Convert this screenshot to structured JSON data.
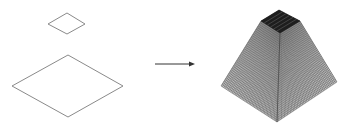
{
  "diagram": {
    "colors": {
      "background": "#ffffff",
      "outline": "#8a8a8a",
      "arrow": "#333333",
      "mesh_line": "#555555",
      "mesh_fill": "#c8c8c8",
      "cap_fill": "#1e1e1e"
    },
    "left_shapes": [
      {
        "name": "small-diamond",
        "points": [
          [
            67,
            13
          ],
          [
            85,
            24
          ],
          [
            67,
            34
          ],
          [
            48,
            24
          ]
        ]
      },
      {
        "name": "large-diamond",
        "points": [
          [
            68,
            55
          ],
          [
            123,
            86
          ],
          [
            68,
            117
          ],
          [
            12,
            86
          ]
        ]
      }
    ],
    "arrow": {
      "x1": 155,
      "y1": 64,
      "x2": 195,
      "y2": 64
    },
    "pyramid": {
      "cap": [
        [
          279,
          10
        ],
        [
          300,
          21
        ],
        [
          280,
          33
        ],
        [
          261,
          21
        ]
      ],
      "base": [
        [
          279,
          48
        ],
        [
          337,
          82
        ],
        [
          277,
          122
        ],
        [
          221,
          86
        ]
      ],
      "grid_divisions": 40
    }
  }
}
